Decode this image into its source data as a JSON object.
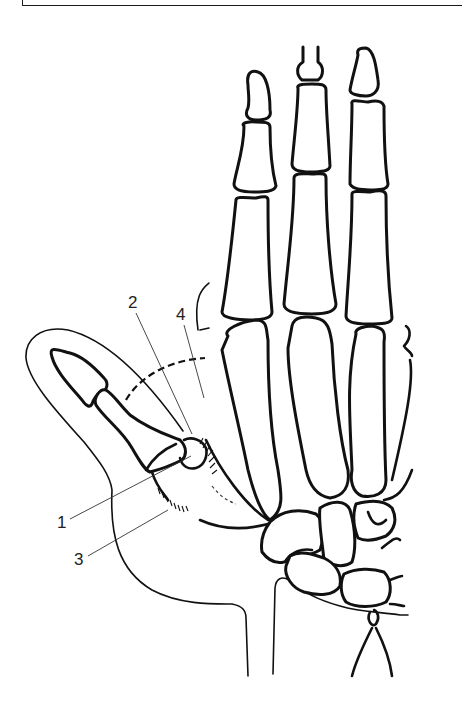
{
  "figure": {
    "labels": [
      {
        "id": "1",
        "text": "1",
        "x": 57,
        "y": 525
      },
      {
        "id": "2",
        "text": "2",
        "x": 128,
        "y": 305
      },
      {
        "id": "3",
        "text": "3",
        "x": 74,
        "y": 562
      },
      {
        "id": "4",
        "text": "4",
        "x": 176,
        "y": 317
      }
    ],
    "colors": {
      "line": "#111111",
      "leader": "#333333",
      "background": "#ffffff"
    }
  }
}
